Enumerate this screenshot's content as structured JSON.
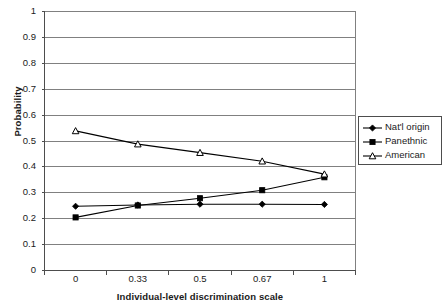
{
  "chart_data": {
    "type": "line",
    "title": "",
    "xlabel": "Individual-level discrimination scale",
    "ylabel": "Probability",
    "categories": [
      "0",
      "0.33",
      "0.5",
      "0.67",
      "1"
    ],
    "ylim": [
      0,
      1
    ],
    "ytick_labels": [
      "1",
      "0.9",
      "0.8",
      "0.7",
      "0.6",
      "0.5",
      "0.4",
      "0.3",
      "0.2",
      "0.1",
      "0"
    ],
    "ytick_values": [
      1,
      0.9,
      0.8,
      0.7,
      0.6,
      0.5,
      0.4,
      0.3,
      0.2,
      0.1,
      0
    ],
    "grid": "horizontal",
    "legend_position": "right",
    "series": [
      {
        "name": "Nat'l origin",
        "marker": "filled-diamond",
        "color": "#000000",
        "values": [
          0.248,
          0.253,
          0.256,
          0.256,
          0.255
        ]
      },
      {
        "name": "Panethnic",
        "marker": "filled-square",
        "color": "#000000",
        "values": [
          0.205,
          0.251,
          0.279,
          0.31,
          0.36
        ]
      },
      {
        "name": "American",
        "marker": "open-triangle",
        "color": "#000000",
        "values": [
          0.539,
          0.488,
          0.455,
          0.422,
          0.372
        ]
      }
    ]
  },
  "axes": {
    "y_title": "Probability",
    "x_title": "Individual-level discrimination scale"
  },
  "legend": {
    "items": [
      {
        "label": "Nat'l origin"
      },
      {
        "label": "Panethnic"
      },
      {
        "label": "American"
      }
    ]
  },
  "colors": {
    "axis": "#4d4d4d",
    "gridline": "#808080",
    "series": "#000000",
    "background": "#ffffff"
  }
}
